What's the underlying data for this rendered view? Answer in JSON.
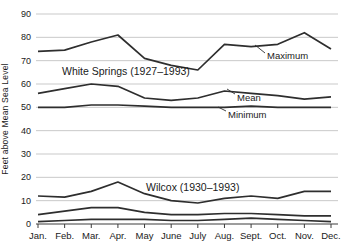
{
  "chart_data": {
    "type": "line",
    "title": "",
    "ylabel": "Feet above Mean Sea Level",
    "xlabel": "",
    "ylim": [
      0,
      90
    ],
    "ytick_step": 10,
    "yticks": [
      0,
      10,
      20,
      30,
      40,
      50,
      60,
      70,
      80,
      90
    ],
    "grid": "horizontal",
    "legend_position": "inline-callouts",
    "categories": [
      "Jan.",
      "Feb.",
      "Mar.",
      "Apr.",
      "May",
      "June",
      "July",
      "Aug.",
      "Sept.",
      "Oct.",
      "Nov.",
      "Dec."
    ],
    "groups": [
      {
        "station_label": "White Springs (1927–1993)",
        "label_x": 62,
        "label_y": 75,
        "series": [
          {
            "name": "Maximum",
            "values": [
              74,
              74.5,
              78,
              81,
              71,
              68,
              66,
              77,
              76,
              77,
              82,
              75
            ]
          },
          {
            "name": "Mean",
            "values": [
              56,
              58,
              60,
              59,
              54,
              53,
              54,
              57,
              56,
              55,
              53.5,
              54.5
            ]
          },
          {
            "name": "Minimum",
            "values": [
              50,
              50,
              51,
              51,
              50.5,
              50,
              50,
              50,
              50.5,
              50,
              50,
              50
            ]
          }
        ]
      },
      {
        "station_label": "Wilcox (1930–1993)",
        "label_x": 146,
        "label_y": 191,
        "series": [
          {
            "name": "Maximum",
            "values": [
              12,
              11.5,
              14,
              18,
              13,
              10,
              9,
              11,
              12,
              11,
              14,
              14
            ]
          },
          {
            "name": "Mean",
            "values": [
              4,
              5.5,
              7,
              7,
              5,
              4,
              4,
              4.5,
              4.5,
              4,
              3.5,
              3.5
            ]
          },
          {
            "name": "Minimum",
            "values": [
              1,
              1.5,
              2,
              2,
              2,
              1.5,
              1.5,
              2,
              2.5,
              2,
              1.5,
              1
            ]
          }
        ]
      }
    ],
    "annotations": [
      {
        "text": "Maximum",
        "text_x": 267,
        "text_y": 59,
        "line": [
          265,
          53,
          255,
          45
        ]
      },
      {
        "text": "Mean",
        "text_x": 237,
        "text_y": 101,
        "line": [
          235,
          94,
          227,
          89
        ]
      },
      {
        "text": "Minimum",
        "text_x": 228,
        "text_y": 118,
        "line": [
          226,
          111,
          218,
          107
        ]
      }
    ],
    "styles": {
      "line_color": "#2e2e2e",
      "grid_color": "#c9c9c9",
      "axis_color": "#3c3c3c",
      "text_color": "#1a1a1a",
      "background": "#ffffff"
    }
  }
}
